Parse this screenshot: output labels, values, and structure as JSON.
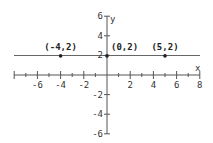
{
  "chart_data": {
    "type": "line",
    "title": "",
    "xlabel": "x",
    "ylabel": "y",
    "xlim": [
      -8,
      8
    ],
    "ylim": [
      -6,
      6
    ],
    "grid": false,
    "x_ticks": [
      -6,
      -4,
      -2,
      2,
      4,
      6,
      8
    ],
    "x_tick_labels": [
      "-6",
      "-4",
      "-2",
      "2",
      "4",
      "6",
      "8"
    ],
    "y_ticks": [
      6,
      4,
      2,
      -2,
      -4,
      -6
    ],
    "y_tick_labels": [
      "6",
      "4",
      "2",
      "-2",
      "-4",
      "-6"
    ],
    "series": [
      {
        "name": "y = 2",
        "x": [
          -8,
          8
        ],
        "y": [
          2,
          2
        ],
        "color": "#555555"
      }
    ],
    "points": [
      {
        "x": -4,
        "y": 2,
        "label": "(-4,2)"
      },
      {
        "x": 0,
        "y": 2,
        "label": "(0,2)"
      },
      {
        "x": 5,
        "y": 2,
        "label": "(5,2)"
      }
    ]
  }
}
